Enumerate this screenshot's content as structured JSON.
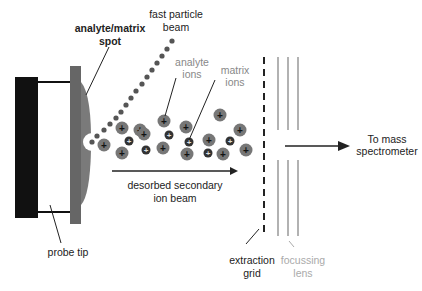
{
  "diagram": {
    "labels": {
      "analyte_matrix_spot_line1": "analyte/matrix",
      "analyte_matrix_spot_line2": "spot",
      "fast_particle_beam_line1": "fast particle",
      "fast_particle_beam_line2": "beam",
      "analyte_ions_line1": "analyte",
      "analyte_ions_line2": "ions",
      "matrix_ions_line1": "matrix",
      "matrix_ions_line2": "ions",
      "desorbed_line1": "desorbed secondary",
      "desorbed_line2": "ion beam",
      "to_mass_line1": "To mass",
      "to_mass_line2": "spectrometer",
      "probe_tip": "probe tip",
      "extraction_grid_line1": "extraction",
      "extraction_grid_line2": "grid",
      "focussing_lens_line1": "focussing",
      "focussing_lens_line2": "lens"
    },
    "ion_symbol": "+",
    "colors": {
      "probe_body": "#111111",
      "probe_plate": "#666666",
      "sample_spot": "#7a7a7a",
      "analyte_ion": "#777777",
      "matrix_ion": "#333333",
      "beam_dots": "#555555",
      "lens": "#999999",
      "grid": "#222222"
    }
  }
}
